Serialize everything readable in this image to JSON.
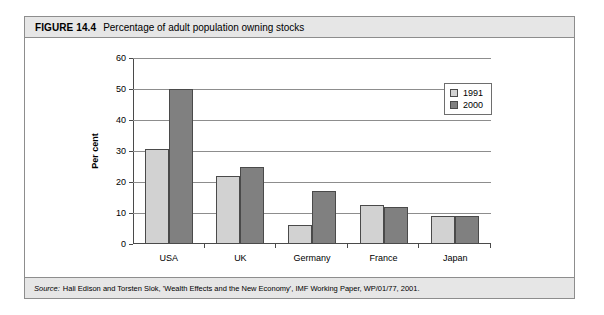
{
  "figure": {
    "label": "FIGURE 14.4",
    "title": "Percentage of adult population owning stocks",
    "source_label": "Source:",
    "source_text": "Hali Edison and Torsten Slok, 'Wealth Effects and the New Economy', IMF Working Paper, WP/01/77, 2001."
  },
  "chart_data": {
    "type": "bar",
    "title": "Percentage of adult population owning stocks",
    "xlabel": "",
    "ylabel": "Per cent",
    "ylim": [
      0,
      60
    ],
    "yticks": [
      0,
      10,
      20,
      30,
      40,
      50,
      60
    ],
    "ytick_labels": [
      "0",
      "10",
      "20",
      "30",
      "40",
      "50",
      "60"
    ],
    "grid": true,
    "legend_position": "top-right",
    "categories": [
      "USA",
      "UK",
      "Germany",
      "France",
      "Japan"
    ],
    "series": [
      {
        "name": "1991",
        "color": "#d2d2d2",
        "values": [
          30.5,
          22,
          6,
          12.5,
          9
        ]
      },
      {
        "name": "2000",
        "color": "#808080",
        "values": [
          50,
          25,
          17,
          12,
          9
        ]
      }
    ]
  },
  "colors": {
    "series_1991": "#d2d2d2",
    "series_2000": "#808080",
    "frame": "#8d8d8d",
    "bar_outline": "#4a4a4a",
    "bar_background": "#e6e6e6"
  }
}
